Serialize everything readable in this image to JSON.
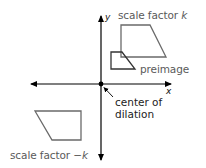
{
  "diagram": {
    "axes": {
      "x_label": "x",
      "y_label": "y",
      "origin": [
        101,
        84
      ],
      "x_range_px": [
        30,
        172
      ],
      "y_range_px": [
        15,
        161
      ],
      "color": "#000000"
    },
    "shapes": [
      {
        "name": "image-scale-k",
        "points": "121,25 150,25 166,57 121,57",
        "stroke": "#6a6a6a"
      },
      {
        "name": "preimage",
        "points": "111,52 122,52 135,69 111,69",
        "stroke": "#333333"
      },
      {
        "name": "image-scale-neg-k",
        "points": "35,111 81,111 81,140 52,140",
        "stroke": "#6a6a6a"
      }
    ],
    "labels": {
      "scale_k_prefix": "scale factor ",
      "scale_k_var": "k",
      "preimage": "preimage",
      "center_line1": "center of",
      "center_line2": "dilation",
      "scale_neg_k_prefix": "scale factor −",
      "scale_neg_k_var": "k"
    },
    "colors": {
      "label_gray": "#5a5a5a",
      "label_dark": "#222222",
      "axis": "#000000"
    }
  }
}
